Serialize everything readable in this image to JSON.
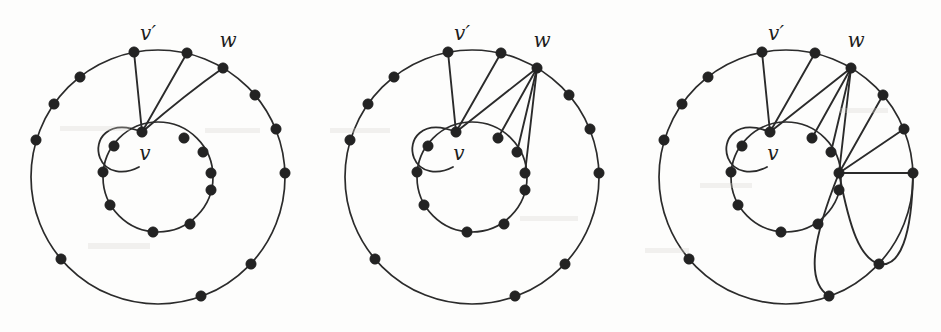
{
  "figure": {
    "caption": "",
    "panel_count": 3,
    "stroke_color": "#2b2b2b",
    "vertex_color": "#232323",
    "background_color": "#fdfdfc"
  },
  "labels": {
    "v_prime": "v′",
    "w": "w",
    "v": "v"
  },
  "geometry": {
    "panel_width": 313,
    "panel_height": 332,
    "center_x": 158,
    "center_y": 177,
    "outer_radius": 127,
    "inner_radius": 55,
    "outer_vertex_count": 12,
    "inner_vertex_count": 10,
    "vertex_dot_radius": 5.2
  },
  "panels": [
    {
      "name": "panel-1",
      "index": 1,
      "label_positions": {
        "v_prime": {
          "x": 148,
          "y": 40
        },
        "w": {
          "x": 228,
          "y": 47
        },
        "v": {
          "x": 145,
          "y": 160
        }
      },
      "outer_vertices": [
        {
          "id": "o0",
          "label": "v′",
          "angle_deg": -101,
          "x": 134,
          "y": 52
        },
        {
          "id": "o1",
          "label": "",
          "angle_deg": -77,
          "x": 187,
          "y": 53
        },
        {
          "id": "o2",
          "label": "w",
          "angle_deg": -59,
          "x": 223,
          "y": 68
        },
        {
          "id": "o3",
          "label": "",
          "angle_deg": -40,
          "x": 255,
          "y": 95
        },
        {
          "id": "o4",
          "label": "",
          "angle_deg": -22,
          "x": 276,
          "y": 129
        },
        {
          "id": "o5",
          "label": "",
          "angle_deg": -2,
          "x": 285,
          "y": 173
        },
        {
          "id": "o6",
          "label": "",
          "angle_deg": 43,
          "x": 251,
          "y": 264
        },
        {
          "id": "o7",
          "label": "",
          "angle_deg": 70,
          "x": 201,
          "y": 296
        },
        {
          "id": "o8",
          "label": "",
          "angle_deg": 140,
          "x": 61,
          "y": 259
        },
        {
          "id": "o9",
          "label": "",
          "angle_deg": 196,
          "x": 36,
          "y": 140
        },
        {
          "id": "o10",
          "label": "",
          "angle_deg": 215,
          "x": 54,
          "y": 104
        },
        {
          "id": "o11",
          "label": "",
          "angle_deg": 232,
          "x": 80,
          "y": 77
        }
      ],
      "inner_vertices": [
        {
          "id": "i0",
          "label": "v",
          "angle_deg": -96,
          "x": 142,
          "y": 132
        },
        {
          "id": "i1",
          "label": "",
          "angle_deg": -62,
          "x": 184,
          "y": 138
        },
        {
          "id": "i2",
          "label": "",
          "angle_deg": -36,
          "x": 203,
          "y": 152
        },
        {
          "id": "i3",
          "label": "",
          "angle_deg": -14,
          "x": 211,
          "y": 173
        },
        {
          "id": "i4",
          "label": "",
          "angle_deg": 14,
          "x": 211,
          "y": 190
        },
        {
          "id": "i5",
          "label": "",
          "angle_deg": 55,
          "x": 190,
          "y": 224
        },
        {
          "id": "i6",
          "label": "",
          "angle_deg": 84,
          "x": 153,
          "y": 232
        },
        {
          "id": "i7",
          "label": "",
          "angle_deg": 150,
          "x": 110,
          "y": 205
        },
        {
          "id": "i8",
          "label": "",
          "angle_deg": 185,
          "x": 103,
          "y": 172
        },
        {
          "id": "i9",
          "label": "",
          "angle_deg": 215,
          "x": 114,
          "y": 146
        }
      ],
      "self_loop_at": "v",
      "fan_from_v": [
        "o0",
        "o1",
        "o2"
      ],
      "fan_from_w": [],
      "fan_from_inner": [],
      "long_curves": []
    },
    {
      "name": "panel-2",
      "index": 2,
      "label_positions": {
        "v_prime": {
          "x": 148,
          "y": 40
        },
        "w": {
          "x": 228,
          "y": 47
        },
        "v": {
          "x": 145,
          "y": 160
        }
      },
      "self_loop_at": "v",
      "fan_from_v": [
        "o0",
        "o1",
        "o2"
      ],
      "fan_from_w": [
        "i0",
        "i1",
        "i2",
        "i3"
      ],
      "fan_from_inner": [],
      "long_curves": []
    },
    {
      "name": "panel-3",
      "index": 3,
      "label_positions": {
        "v_prime": {
          "x": 148,
          "y": 40
        },
        "w": {
          "x": 228,
          "y": 47
        },
        "v": {
          "x": 145,
          "y": 160
        }
      },
      "self_loop_at": "v",
      "fan_from_v": [
        "o0",
        "o1",
        "o2"
      ],
      "fan_from_w": [
        "i0",
        "i1",
        "i2",
        "i3"
      ],
      "fan_from_inner": [
        "o3",
        "o4",
        "o5"
      ],
      "long_curves": [
        "i3-o6",
        "i3-o7"
      ]
    }
  ]
}
